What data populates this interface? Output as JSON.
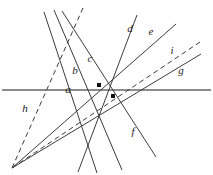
{
  "figure": {
    "type": "geometry-line-diagram",
    "width": 213,
    "height": 175,
    "background": "#ffffff",
    "stroke_color": "#3c3c3c",
    "axis_color": "#8c8c8c",
    "point_color": "#111111",
    "labels": [
      {
        "id": "a",
        "text": "a",
        "x": 68,
        "y": 89,
        "line": "a"
      },
      {
        "id": "b",
        "text": "b",
        "x": 75,
        "y": 70,
        "line": "b"
      },
      {
        "id": "c",
        "text": "c",
        "x": 90,
        "y": 58,
        "line": "c"
      },
      {
        "id": "d",
        "text": "d",
        "x": 130,
        "y": 28,
        "line": "d"
      },
      {
        "id": "e",
        "text": "e",
        "x": 151,
        "y": 31,
        "line": "e"
      },
      {
        "id": "f",
        "text": "f",
        "x": 133,
        "y": 131,
        "line": "f"
      },
      {
        "id": "g",
        "text": "g",
        "x": 181,
        "y": 70,
        "line": "g"
      },
      {
        "id": "h",
        "text": "h",
        "x": 25,
        "y": 108,
        "line": "h"
      },
      {
        "id": "i",
        "text": "i",
        "x": 172,
        "y": 50,
        "line": "i"
      }
    ],
    "lines": [
      {
        "id": "a",
        "name": "line-a-horizontal",
        "x1": 2,
        "y1": 90,
        "x2": 211,
        "y2": 90,
        "dashed": false,
        "color": "#8c8c8c",
        "width": 2.1
      },
      {
        "id": "b",
        "name": "line-b",
        "x1": 44,
        "y1": 12,
        "x2": 97,
        "y2": 173,
        "dashed": false,
        "color": "#3c3c3c",
        "width": 1.0
      },
      {
        "id": "c",
        "name": "line-c",
        "x1": 54,
        "y1": 10,
        "x2": 122,
        "y2": 170,
        "dashed": false,
        "color": "#3c3c3c",
        "width": 1.0
      },
      {
        "id": "d",
        "name": "line-d",
        "x1": 137,
        "y1": 15,
        "x2": 78,
        "y2": 172,
        "dashed": false,
        "color": "#3c3c3c",
        "width": 1.0
      },
      {
        "id": "e",
        "name": "line-e",
        "x1": 176,
        "y1": 24,
        "x2": 12,
        "y2": 168,
        "dashed": false,
        "color": "#3c3c3c",
        "width": 1.0
      },
      {
        "id": "f",
        "name": "line-f",
        "x1": 62,
        "y1": 11,
        "x2": 156,
        "y2": 157,
        "dashed": false,
        "color": "#3c3c3c",
        "width": 1.0
      },
      {
        "id": "g",
        "name": "line-g",
        "x1": 201,
        "y1": 54,
        "x2": 12,
        "y2": 168,
        "dashed": false,
        "color": "#3c3c3c",
        "width": 1.0
      },
      {
        "id": "h",
        "name": "line-h-dashed",
        "x1": 83,
        "y1": 8,
        "x2": 12,
        "y2": 168,
        "dashed": true,
        "color": "#3c3c3c",
        "width": 1.0
      },
      {
        "id": "i",
        "name": "line-i-dashed",
        "x1": 200,
        "y1": 42,
        "x2": 12,
        "y2": 168,
        "dashed": true,
        "color": "#3c3c3c",
        "width": 1.0
      }
    ],
    "points": [
      {
        "id": "p1",
        "name": "marked-point-upper",
        "x": 99,
        "y": 85,
        "size": 4
      },
      {
        "id": "p2",
        "name": "marked-point-lower",
        "x": 113,
        "y": 96,
        "size": 4
      }
    ],
    "vertices": [
      {
        "id": "v-top",
        "name": "upper-pencil-vertex",
        "x": 68,
        "y": 48
      },
      {
        "id": "v-bottomleft",
        "name": "lower-left-pencil-vertex",
        "x": 12,
        "y": 168
      }
    ]
  }
}
